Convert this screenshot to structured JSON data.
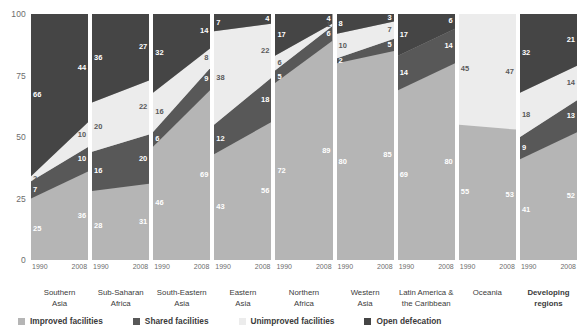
{
  "chart_data": {
    "type": "area",
    "title": "",
    "subtitle": "",
    "xlabel": "",
    "ylabel": "",
    "ylim": [
      0,
      100
    ],
    "yticks": [
      0,
      25,
      50,
      75,
      100
    ],
    "ytick_labels": [
      "0",
      "25",
      "50",
      "75",
      "100"
    ],
    "grid": false,
    "legend_position": "bottom",
    "x": [
      "1990",
      "2008"
    ],
    "stack_order_bottom_to_top": [
      "Improved facilities",
      "Shared facilities",
      "Unimproved facilities",
      "Open defecation"
    ],
    "series": [
      {
        "name": "Improved facilities",
        "color": "#b5b5b5"
      },
      {
        "name": "Shared facilities",
        "color": "#585858"
      },
      {
        "name": "Unimproved facilities",
        "color": "#ececec"
      },
      {
        "name": "Open defecation",
        "color": "#454545"
      }
    ],
    "panels": [
      {
        "region": "Southern\nAsia",
        "bold": false,
        "values_1990": {
          "improved": 25,
          "shared": 7,
          "unimproved": 2,
          "open": 66
        },
        "values_2008": {
          "improved": 36,
          "shared": 10,
          "unimproved": 10,
          "open": 44
        }
      },
      {
        "region": "Sub-Saharan\nAfrica",
        "bold": false,
        "values_1990": {
          "improved": 28,
          "shared": 16,
          "unimproved": 20,
          "open": 36
        },
        "values_2008": {
          "improved": 31,
          "shared": 20,
          "unimproved": 22,
          "open": 27
        }
      },
      {
        "region": "South-Eastern\nAsia",
        "bold": false,
        "values_1990": {
          "improved": 46,
          "shared": 6,
          "unimproved": 16,
          "open": 32
        },
        "values_2008": {
          "improved": 69,
          "shared": 9,
          "unimproved": 8,
          "open": 14
        }
      },
      {
        "region": "Eastern\nAsia",
        "bold": false,
        "values_1990": {
          "improved": 43,
          "shared": 12,
          "unimproved": 38,
          "open": 7
        },
        "values_2008": {
          "improved": 56,
          "shared": 18,
          "unimproved": 22,
          "open": 4
        }
      },
      {
        "region": "Northern\nAfrica",
        "bold": false,
        "values_1990": {
          "improved": 72,
          "shared": 5,
          "unimproved": 6,
          "open": 17
        },
        "values_2008": {
          "improved": 89,
          "shared": 6,
          "unimproved": 1,
          "open": 4
        }
      },
      {
        "region": "Western\nAsia",
        "bold": false,
        "values_1990": {
          "improved": 80,
          "shared": 2,
          "unimproved": 10,
          "open": 8
        },
        "values_2008": {
          "improved": 85,
          "shared": 5,
          "unimproved": 7,
          "open": 3
        }
      },
      {
        "region": "Latin America &\nthe Caribbean",
        "bold": false,
        "values_1990": {
          "improved": 69,
          "shared": 14,
          "unimproved": 0,
          "open": 17
        },
        "values_2008": {
          "improved": 80,
          "shared": 14,
          "unimproved": 0,
          "open": 6
        }
      },
      {
        "region": "Oceania",
        "bold": false,
        "values_1990": {
          "improved": 55,
          "shared": 0,
          "unimproved": 45,
          "open": 0
        },
        "values_2008": {
          "improved": 53,
          "shared": 0,
          "unimproved": 47,
          "open": 0
        }
      },
      {
        "region": "Developing\nregions",
        "bold": true,
        "values_1990": {
          "improved": 41,
          "shared": 9,
          "unimproved": 18,
          "open": 32
        },
        "values_2008": {
          "improved": 52,
          "shared": 13,
          "unimproved": 14,
          "open": 21
        }
      }
    ]
  },
  "axis": {
    "ticks": [
      "100",
      "75",
      "50",
      "25",
      "0"
    ]
  },
  "years": {
    "start": "1990",
    "end": "2008"
  },
  "legend": {
    "items": [
      {
        "label": "Improved facilities",
        "color": "#b5b5b5"
      },
      {
        "label": "Shared facilities",
        "color": "#585858"
      },
      {
        "label": "Unimproved facilities",
        "color": "#ececec"
      },
      {
        "label": "Open defecation",
        "color": "#454545"
      }
    ]
  },
  "regions": [
    "Southern\nAsia",
    "Sub-Saharan\nAfrica",
    "South-Eastern\nAsia",
    "Eastern\nAsia",
    "Northern\nAfrica",
    "Western\nAsia",
    "Latin America &\nthe Caribbean",
    "Oceania",
    "Developing\nregions"
  ]
}
